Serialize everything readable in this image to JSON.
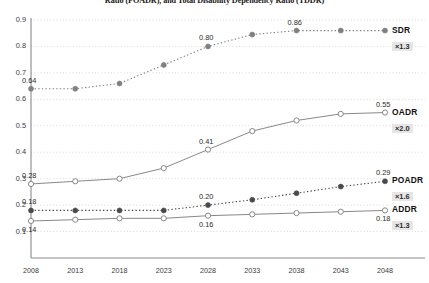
{
  "chart_data": {
    "type": "line",
    "title": "Ratio (POADR), and Total Disability Dependency Ratio (TDDR)",
    "xlabel": "",
    "ylabel": "",
    "x": [
      2008,
      2013,
      2018,
      2023,
      2028,
      2033,
      2038,
      2043,
      2048
    ],
    "categories": [
      "2008",
      "2013",
      "2018",
      "2023",
      "2028",
      "2033",
      "2038",
      "2043",
      "2048"
    ],
    "ylim": [
      0.0,
      0.9
    ],
    "yticks": [
      0.1,
      0.2,
      0.3,
      0.4,
      0.5,
      0.6,
      0.7,
      0.8,
      0.9
    ],
    "ytick_labels": [
      "0.1",
      "0.2",
      "0.3",
      "0.4",
      "0.5",
      "0.6",
      "0.7",
      "0.8",
      "0.9"
    ],
    "grid": true,
    "grid_style": "dotted-horizontal",
    "legend_position": "right",
    "series": [
      {
        "name": "SDR",
        "multiplier": "×1.3",
        "style": "dotted",
        "marker": "filled-circle",
        "color": "#808080",
        "values": [
          0.64,
          0.64,
          0.66,
          0.73,
          0.8,
          0.845,
          0.86,
          0.86,
          0.86
        ],
        "labels": [
          {
            "index": 0,
            "text": "0.64",
            "position": "above"
          },
          {
            "index": 4,
            "text": "0.80",
            "position": "above"
          },
          {
            "index": 6,
            "text": "0.86",
            "position": "above"
          }
        ]
      },
      {
        "name": "OADR",
        "multiplier": "×2.0",
        "style": "solid",
        "marker": "open-circle",
        "color": "#7a7a7a",
        "values": [
          0.28,
          0.29,
          0.3,
          0.34,
          0.41,
          0.48,
          0.52,
          0.545,
          0.55
        ],
        "labels": [
          {
            "index": 0,
            "text": "0.28",
            "position": "above"
          },
          {
            "index": 4,
            "text": "0.41",
            "position": "above"
          },
          {
            "index": 8,
            "text": "0.55",
            "position": "above"
          }
        ]
      },
      {
        "name": "POADR",
        "multiplier": "×1.6",
        "style": "dotted",
        "marker": "filled-circle",
        "color": "#4a4a4a",
        "values": [
          0.18,
          0.18,
          0.18,
          0.18,
          0.2,
          0.22,
          0.245,
          0.27,
          0.29
        ],
        "labels": [
          {
            "index": 0,
            "text": "0.18",
            "position": "above"
          },
          {
            "index": 4,
            "text": "0.20",
            "position": "above"
          },
          {
            "index": 8,
            "text": "0.29",
            "position": "above"
          }
        ]
      },
      {
        "name": "ADDR",
        "multiplier": "×1.3",
        "style": "solid",
        "marker": "open-circle",
        "color": "#7a7a7a",
        "values": [
          0.14,
          0.145,
          0.15,
          0.15,
          0.16,
          0.165,
          0.17,
          0.175,
          0.18
        ],
        "labels": [
          {
            "index": 0,
            "text": "0.14",
            "position": "below"
          },
          {
            "index": 4,
            "text": "0.16",
            "position": "below"
          },
          {
            "index": 8,
            "text": "0.18",
            "position": "below"
          }
        ]
      }
    ]
  }
}
